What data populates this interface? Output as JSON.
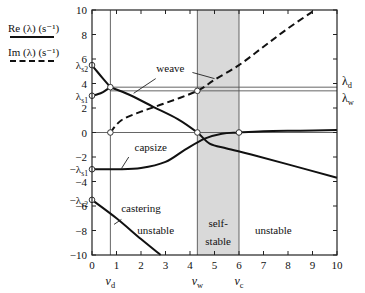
{
  "legend": {
    "re_label": "Re (λ) (s⁻¹)",
    "im_label": "Im (λ) (s⁻¹)"
  },
  "chart_data": {
    "type": "line",
    "title": "",
    "xlabel": "",
    "ylabel": "",
    "xlim": [
      0,
      10
    ],
    "ylim": [
      -10,
      10
    ],
    "x_ticks": [
      0,
      1,
      2,
      3,
      4,
      5,
      6,
      7,
      8,
      9,
      10
    ],
    "y_ticks": [
      -10,
      -8,
      -6,
      -4,
      -2,
      0,
      2,
      4,
      6,
      8,
      10
    ],
    "grid": false,
    "legend_position": "upper-left-outside",
    "shaded_region": {
      "x": [
        4.3,
        6.0
      ],
      "label": "self-stable",
      "color": "#d9d9d9"
    },
    "vertical_markers": [
      {
        "x": 0.75,
        "label": "v_d"
      },
      {
        "x": 4.3,
        "label": "v_w"
      },
      {
        "x": 6.0,
        "label": "v_c"
      }
    ],
    "horizontal_markers": [
      {
        "y": 3.7,
        "label": "λ_d"
      },
      {
        "y": 3.4,
        "label": "λ_w"
      },
      {
        "y": 0,
        "label": ""
      }
    ],
    "left_labels": [
      {
        "y": 5.5,
        "label": "λ_s2"
      },
      {
        "y": 3.0,
        "label": "λ_s1"
      },
      {
        "y": -3.0,
        "label": "−λ_s1"
      },
      {
        "y": -5.5,
        "label": "−λ_s2"
      }
    ],
    "region_labels": [
      {
        "text": "unstable",
        "x": 2.6,
        "y": -8.3
      },
      {
        "text": "self-",
        "x": 5.15,
        "y": -7.7
      },
      {
        "text": "stable",
        "x": 5.15,
        "y": -9.2
      },
      {
        "text": "unstable",
        "x": 7.4,
        "y": -8.3
      }
    ],
    "series": [
      {
        "name": "weave Re (upper branch)",
        "style": "solid",
        "x": [
          0,
          0.2,
          0.45,
          0.75
        ],
        "y": [
          5.5,
          5.0,
          4.4,
          3.7
        ]
      },
      {
        "name": "capsize Re (lower branch, low v)",
        "style": "solid",
        "x": [
          0,
          0.2,
          0.45,
          0.75
        ],
        "y": [
          3.0,
          3.1,
          3.3,
          3.7
        ]
      },
      {
        "name": "weave Re",
        "style": "solid",
        "label": "weave",
        "x": [
          0.75,
          1.5,
          2.5,
          3.5,
          4.3,
          4.8,
          5.5,
          6.5,
          8,
          10
        ],
        "y": [
          3.7,
          3.1,
          2.1,
          1.1,
          0,
          -0.9,
          -1.3,
          -1.8,
          -2.6,
          -3.7
        ]
      },
      {
        "name": "weave Im",
        "style": "dashed",
        "x": [
          0.75,
          1.2,
          2,
          3,
          4.3,
          5,
          6,
          7,
          8,
          9.1
        ],
        "y": [
          0,
          1.0,
          1.7,
          2.4,
          3.4,
          4.3,
          5.5,
          7.0,
          8.5,
          10
        ]
      },
      {
        "name": "capsize Re",
        "style": "solid",
        "label": "capsize",
        "x": [
          0,
          1,
          2,
          3,
          3.8,
          4.6,
          5.3,
          6.0,
          7,
          8.5,
          10
        ],
        "y": [
          -3.0,
          -3.0,
          -2.9,
          -2.4,
          -1.4,
          -0.5,
          -0.1,
          0,
          0.1,
          0.15,
          0.2
        ]
      },
      {
        "name": "castering Re",
        "style": "solid",
        "label": "castering",
        "x": [
          0,
          1,
          2,
          2.8
        ],
        "y": [
          -5.5,
          -7.0,
          -8.7,
          -10
        ]
      }
    ],
    "markers": [
      {
        "x": 0,
        "y": 5.5
      },
      {
        "x": 0,
        "y": 3.0
      },
      {
        "x": 0.75,
        "y": 3.7
      },
      {
        "x": 0.75,
        "y": 0
      },
      {
        "x": 4.3,
        "y": 3.4
      },
      {
        "x": 4.3,
        "y": 0
      },
      {
        "x": 6.0,
        "y": 0
      },
      {
        "x": 0,
        "y": -3.0
      },
      {
        "x": 0,
        "y": -5.5
      }
    ]
  }
}
